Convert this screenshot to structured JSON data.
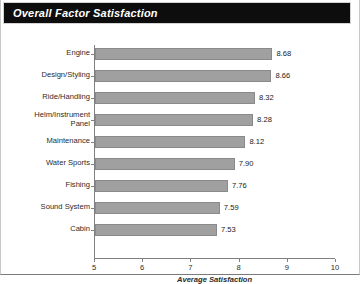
{
  "title": "Overall Factor Satisfaction",
  "chart_data": {
    "type": "bar",
    "orientation": "horizontal",
    "title": "Overall Factor Satisfaction",
    "xlabel": "Average Satisfaction",
    "ylabel": "",
    "xlim": [
      5,
      10
    ],
    "xticks": [
      "5",
      "6",
      "7",
      "8",
      "9",
      "10"
    ],
    "grid": false,
    "legend": null,
    "bar_color": "#a0a0a0",
    "bar_edge_color": "#8a8a8a",
    "banner_color": "#0d0d0d",
    "categories": [
      "Engine",
      "Design/Styling",
      "Ride/Handling",
      "Helm/Instrument\nPanel",
      "Maintenance",
      "Water Sports",
      "Fishing",
      "Sound System",
      "Cabin"
    ],
    "values": [
      8.68,
      8.66,
      8.32,
      8.28,
      8.12,
      7.9,
      7.76,
      7.59,
      7.53
    ],
    "value_labels": [
      "8.68",
      "8.66",
      "8.32",
      "8.28",
      "8.12",
      "7.90",
      "7.76",
      "7.59",
      "7.53"
    ]
  }
}
